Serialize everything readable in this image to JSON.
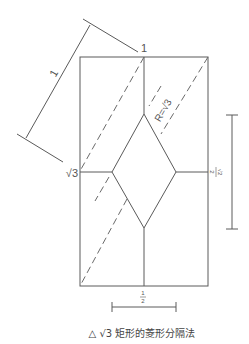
{
  "diagram": {
    "type": "geometric construction",
    "caption": "△ √3 矩形的菱形分隔法",
    "labels": {
      "top_width": "1",
      "diagonal_dimension": "1",
      "left_height_mark": "√3",
      "radius": "R=√3",
      "right_dimension_num": "√2",
      "right_dimension_den": "2",
      "bottom_dimension_num": "1",
      "bottom_dimension_den": "2"
    },
    "colors": {
      "line": "#5a5a5a",
      "text": "#555555",
      "background": "#ffffff"
    }
  }
}
